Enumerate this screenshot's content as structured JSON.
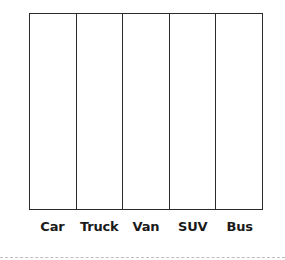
{
  "chart_data": {
    "type": "bar",
    "title": "",
    "xlabel": "",
    "ylabel": "",
    "categories": [
      "Car",
      "Truck",
      "Van",
      "SUV",
      "Bus"
    ],
    "values": [
      null,
      null,
      null,
      null,
      null
    ],
    "grid": true,
    "legend": null,
    "note": "Empty bar-graph template: five blank columns with category labels, no data filled in"
  },
  "labels": [
    "Car",
    "Truck",
    "Van",
    "SUV",
    "Bus"
  ]
}
